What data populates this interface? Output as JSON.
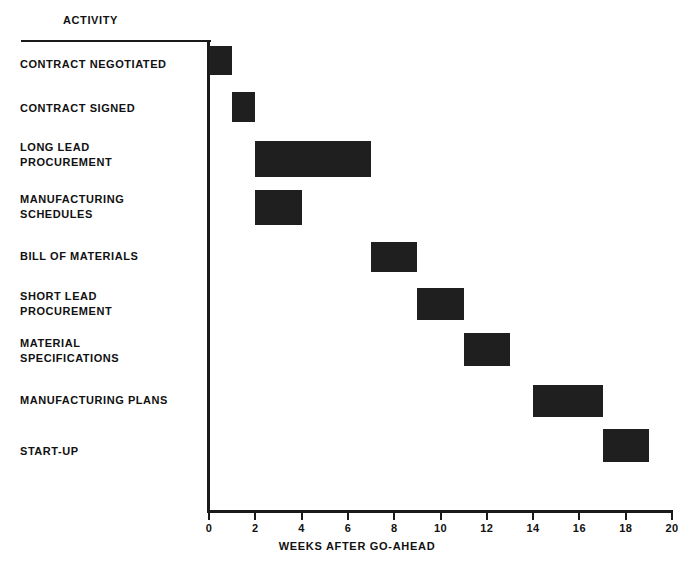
{
  "header": {
    "activity_column_title": "ACTIVITY"
  },
  "axis": {
    "x_title": "WEEKS AFTER GO-AHEAD",
    "x_ticks": [
      "0",
      "2",
      "4",
      "6",
      "8",
      "10",
      "12",
      "14",
      "16",
      "18",
      "20"
    ]
  },
  "colors": {
    "bar_fill": "#1f1f1f",
    "axis": "#1a1a1a",
    "text": "#111111",
    "background": "#ffffff"
  },
  "chart_data": {
    "type": "bar",
    "title": "",
    "xlabel": "WEEKS AFTER GO-AHEAD",
    "ylabel": "ACTIVITY",
    "xlim": [
      0,
      20
    ],
    "grid": false,
    "legend": "none",
    "orientation": "horizontal-gantt",
    "xticks": [
      0,
      2,
      4,
      6,
      8,
      10,
      12,
      14,
      16,
      18,
      20
    ],
    "categories": [
      "CONTRACT NEGOTIATED",
      "CONTRACT SIGNED",
      "LONG LEAD\nPROCUREMENT",
      "MANUFACTURING\nSCHEDULES",
      "BILL OF MATERIALS",
      "SHORT LEAD\nPROCUREMENT",
      "MATERIAL\nSPECIFICATIONS",
      "MANUFACTURING PLANS",
      "START-UP"
    ],
    "tasks": [
      {
        "label": "CONTRACT NEGOTIATED",
        "start": 0,
        "end": 1,
        "label_top": 57,
        "bar_top": 46,
        "bar_height": 29
      },
      {
        "label": "CONTRACT SIGNED",
        "start": 1,
        "end": 2,
        "label_top": 101,
        "bar_top": 92,
        "bar_height": 30
      },
      {
        "label": "LONG LEAD\nPROCUREMENT",
        "start": 2,
        "end": 7,
        "label_top": 140,
        "bar_top": 141,
        "bar_height": 36
      },
      {
        "label": "MANUFACTURING\nSCHEDULES",
        "start": 2,
        "end": 4,
        "label_top": 192,
        "bar_top": 190,
        "bar_height": 35
      },
      {
        "label": "BILL OF MATERIALS",
        "start": 7,
        "end": 9,
        "label_top": 249,
        "bar_top": 242,
        "bar_height": 30
      },
      {
        "label": "SHORT LEAD\nPROCUREMENT",
        "start": 9,
        "end": 11,
        "label_top": 289,
        "bar_top": 288,
        "bar_height": 32
      },
      {
        "label": "MATERIAL\nSPECIFICATIONS",
        "start": 11,
        "end": 13,
        "label_top": 336,
        "bar_top": 333,
        "bar_height": 33
      },
      {
        "label": "MANUFACTURING PLANS",
        "start": 14,
        "end": 17,
        "label_top": 393,
        "bar_top": 385,
        "bar_height": 32
      },
      {
        "label": "START-UP",
        "start": 17,
        "end": 19,
        "label_top": 444,
        "bar_top": 429,
        "bar_height": 33
      }
    ]
  }
}
